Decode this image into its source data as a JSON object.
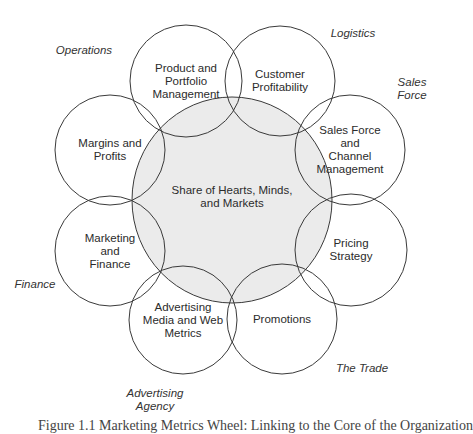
{
  "diagram": {
    "center": {
      "label": "Share of Hearts, Minds,\nand Markets",
      "cx": 232,
      "cy": 200,
      "rx": 100,
      "ry": 103,
      "fill": "#ebebeb",
      "stroke": "#3a3a3a"
    },
    "nodes": [
      {
        "label": "Product and\nPortfolio\nManagement",
        "cx": 186,
        "cy": 81,
        "r": 56
      },
      {
        "label": "Customer\nProfitability",
        "cx": 280,
        "cy": 81,
        "r": 55
      },
      {
        "label": "Sales Force\nand\nChannel\nManagement",
        "cx": 350,
        "cy": 150,
        "r": 55
      },
      {
        "label": "Pricing\nStrategy",
        "cx": 351,
        "cy": 250,
        "r": 56
      },
      {
        "label": "Promotions",
        "cx": 282,
        "cy": 319,
        "r": 55
      },
      {
        "label": "Advertising\nMedia and Web\nMetrics",
        "cx": 183,
        "cy": 320,
        "r": 54
      },
      {
        "label": "Marketing\nand\nFinance",
        "cx": 110,
        "cy": 251,
        "r": 55
      },
      {
        "label": "Margins and\nProfits",
        "cx": 110,
        "cy": 150,
        "r": 55
      }
    ],
    "stakeholders": [
      {
        "label": "Operations",
        "x": 84,
        "y": 50
      },
      {
        "label": "Logistics",
        "x": 353,
        "y": 33
      },
      {
        "label": "Sales Force",
        "x": 412,
        "y": 89
      },
      {
        "label": "Finance",
        "x": 35,
        "y": 284
      },
      {
        "label": "The Trade",
        "x": 362,
        "y": 368
      },
      {
        "label": "Advertising\nAgency",
        "x": 155,
        "y": 400
      }
    ],
    "stroke_color": "#3a3a3a",
    "caption": "Figure 1.1  Marketing Metrics Wheel: Linking to the Core of the Organization"
  }
}
